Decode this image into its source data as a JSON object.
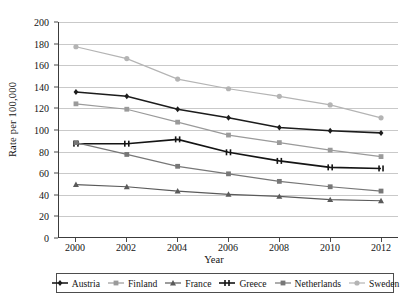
{
  "chart_data": {
    "type": "line",
    "title": "",
    "xlabel": "Year",
    "ylabel": "Rate per 100,000",
    "x": [
      2000,
      2002,
      2004,
      2006,
      2008,
      2010,
      2012
    ],
    "xticklabels": [
      "2000",
      "2002",
      "2004",
      "2006",
      "2008",
      "2010",
      "2012"
    ],
    "yticklabels": [
      "0",
      "20",
      "40",
      "60",
      "80",
      "100",
      "120",
      "140",
      "160",
      "180",
      "200"
    ],
    "yticks": [
      0,
      20,
      40,
      60,
      80,
      100,
      120,
      140,
      160,
      180,
      200
    ],
    "ylim": [
      0,
      200
    ],
    "xlim": [
      2000,
      2012
    ],
    "grid": "horizontal",
    "legend_position": "bottom",
    "series": [
      {
        "name": "Austria",
        "color": "#1c1c1c",
        "marker": "diamond",
        "values": [
          135,
          131,
          119,
          111,
          102,
          99,
          97
        ]
      },
      {
        "name": "Finland",
        "color": "#9a9a9a",
        "marker": "square",
        "values": [
          124,
          119,
          107,
          95,
          88,
          81,
          75
        ]
      },
      {
        "name": "France",
        "color": "#5a5a5a",
        "marker": "triangle",
        "values": [
          49,
          47,
          43,
          40,
          38,
          35,
          34
        ]
      },
      {
        "name": "Greece",
        "color": "#141414",
        "marker": "bowtie",
        "values": [
          87,
          87,
          91,
          79,
          71,
          65,
          64
        ]
      },
      {
        "name": "Netherlands",
        "color": "#777777",
        "marker": "square",
        "values": [
          88,
          77,
          66,
          59,
          52,
          47,
          43
        ]
      },
      {
        "name": "Sweden",
        "color": "#b4b4b4",
        "marker": "circle",
        "values": [
          177,
          166,
          147,
          138,
          131,
          123,
          111
        ]
      }
    ]
  }
}
